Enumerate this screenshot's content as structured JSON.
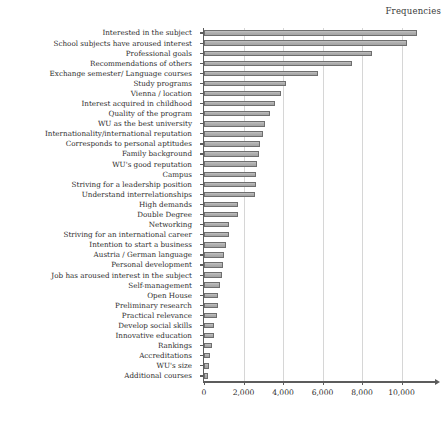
{
  "chart": {
    "series_title": "Frequencies",
    "type_label": "horizontal-bar"
  },
  "axis": {
    "x_tick_labels": [
      "0",
      "2,000",
      "4,000",
      "6,000",
      "8,000",
      "10,000"
    ],
    "x_tick_values": [
      0,
      2000,
      4000,
      6000,
      8000,
      10000
    ]
  },
  "chart_data": {
    "type": "bar",
    "orientation": "horizontal",
    "title": "",
    "subtitle": "",
    "xlabel": "Frequencies",
    "ylabel": "",
    "legend": [
      "Frequencies"
    ],
    "legend_position": "top-right",
    "grid": "vertical-only",
    "xlim": [
      0,
      11800
    ],
    "xticks": [
      0,
      2000,
      4000,
      6000,
      8000,
      10000
    ],
    "xtick_labels": [
      "0",
      "2,000",
      "4,000",
      "6,000",
      "8,000",
      "10,000"
    ],
    "sorted": "descending",
    "categories": [
      "Interested in the subject",
      "School subjects have aroused interest",
      "Professional goals",
      "Recommendations of others",
      "Exchange semester/ Language courses",
      "Study programs",
      "Vienna / location",
      "Interest acquired in childhood",
      "Quality of the program",
      "WU as the best university",
      "Internationality/international reputation",
      "Corresponds to personal aptitudes",
      "Family background",
      "WU's good reputation",
      "Campus",
      "Striving for a leadership position",
      "Understand interrelationships",
      "High demands",
      "Double Degree",
      "Networking",
      "Striving for an international career",
      "Intention to start a business",
      "Austria / German language",
      "Personal development",
      "Job has aroused interest in the subject",
      "Self-management",
      "Open House",
      "Preliminary research",
      "Practical relevance",
      "Develop social skills",
      "Innovative education",
      "Rankings",
      "Accreditations",
      "WU's size",
      "Additional courses"
    ],
    "values": [
      10800,
      10280,
      8500,
      7480,
      5770,
      4150,
      3900,
      3600,
      3340,
      3090,
      3000,
      2830,
      2780,
      2700,
      2650,
      2620,
      2600,
      1720,
      1700,
      1280,
      1250,
      1120,
      1000,
      950,
      900,
      830,
      720,
      700,
      670,
      530,
      500,
      380,
      290,
      250,
      210
    ]
  }
}
